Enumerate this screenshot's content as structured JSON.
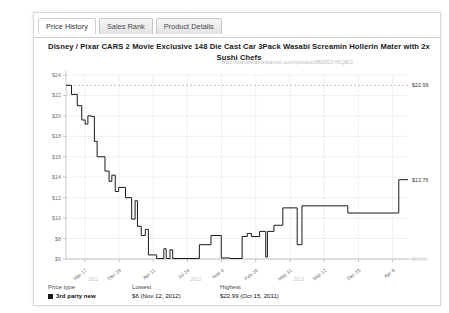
{
  "tabs": [
    {
      "label": "Price History",
      "active": true
    },
    {
      "label": "Sales Rank",
      "active": false
    },
    {
      "label": "Product Details",
      "active": false
    }
  ],
  "chart_data": {
    "type": "line",
    "title": "Disney / Pixar CARS 2 Movie Exclusive 148 Die Cast Car 3Pack Wasabi Screamin Hollerin Mater with 2x Sushi Chefs",
    "url": "http://camelcamelcamel.com/product/B0053YRQEG",
    "xlabel": "",
    "ylabel": "",
    "ylim": [
      6,
      24
    ],
    "ytick_labels": [
      "$24",
      "$22",
      "$20",
      "$18",
      "$16",
      "$14",
      "$12",
      "$10",
      "$8",
      "$6"
    ],
    "ytick_values": [
      24,
      22,
      20,
      18,
      16,
      14,
      12,
      10,
      8,
      6
    ],
    "xtick_labels": [
      "Mar 17",
      "Dec 29",
      "Apr 11",
      "Jul 24",
      "Nov 4",
      "Feb 16",
      "May 31",
      "Sep 12",
      "Dec 25",
      "Apr 8"
    ],
    "year_markers": [
      "2011",
      "2012",
      "2013"
    ],
    "grid": true,
    "legend_position": "below",
    "annotations": [
      {
        "label": "$22.99",
        "value": 22.99,
        "position": "right-top",
        "type": "highest"
      },
      {
        "label": "$13.76",
        "value": 13.76,
        "position": "right-current",
        "type": "current"
      },
      {
        "label": "$6.00",
        "value": 6.0,
        "position": "right-bottom",
        "type": "lowest"
      }
    ],
    "series": [
      {
        "name": "3rd party new",
        "color": "#1a1a1a",
        "step": true,
        "points": [
          [
            0.0,
            22.99
          ],
          [
            1.6,
            22.99
          ],
          [
            1.6,
            22.1
          ],
          [
            3.3,
            22.1
          ],
          [
            3.3,
            21.0
          ],
          [
            4.6,
            21.0
          ],
          [
            4.6,
            19.6
          ],
          [
            5.6,
            19.6
          ],
          [
            5.6,
            19.2
          ],
          [
            6.4,
            19.2
          ],
          [
            6.4,
            20.0
          ],
          [
            7.4,
            20.0
          ],
          [
            7.4,
            19.95
          ],
          [
            8.3,
            19.95
          ],
          [
            8.3,
            17.5
          ],
          [
            9.1,
            17.5
          ],
          [
            9.1,
            16.0
          ],
          [
            11.4,
            16.0
          ],
          [
            11.4,
            14.6
          ],
          [
            12.6,
            14.6
          ],
          [
            12.6,
            13.6
          ],
          [
            13.4,
            13.6
          ],
          [
            13.4,
            14.2
          ],
          [
            14.4,
            14.2
          ],
          [
            14.4,
            12.6
          ],
          [
            15.4,
            12.6
          ],
          [
            15.4,
            13.0
          ],
          [
            17.4,
            13.0
          ],
          [
            17.4,
            12.0
          ],
          [
            19.2,
            12.0
          ],
          [
            19.2,
            9.9
          ],
          [
            20.2,
            9.9
          ],
          [
            20.2,
            11.7
          ],
          [
            20.9,
            11.7
          ],
          [
            20.9,
            9.2
          ],
          [
            22.0,
            9.2
          ],
          [
            22.0,
            8.3
          ],
          [
            23.2,
            8.3
          ],
          [
            23.2,
            8.9
          ],
          [
            24.1,
            8.9
          ],
          [
            24.1,
            6.4
          ],
          [
            26.5,
            6.4
          ],
          [
            26.5,
            6.05
          ],
          [
            28.6,
            6.05
          ],
          [
            28.6,
            7.0
          ],
          [
            29.3,
            7.0
          ],
          [
            29.3,
            6.05
          ],
          [
            30.4,
            6.05
          ],
          [
            30.4,
            6.9
          ],
          [
            31.2,
            6.9
          ],
          [
            31.2,
            6.05
          ],
          [
            39.0,
            6.05
          ],
          [
            39.0,
            7.4
          ],
          [
            42.4,
            7.4
          ],
          [
            42.4,
            8.3
          ],
          [
            45.4,
            8.3
          ],
          [
            45.4,
            6.1
          ],
          [
            48.0,
            6.1
          ],
          [
            48.0,
            6.05
          ],
          [
            51.5,
            6.05
          ],
          [
            51.5,
            8.2
          ],
          [
            53.0,
            8.2
          ],
          [
            53.0,
            8.5
          ],
          [
            54.2,
            8.5
          ],
          [
            54.2,
            8.2
          ],
          [
            56.6,
            8.2
          ],
          [
            56.6,
            8.7
          ],
          [
            58.4,
            8.7
          ],
          [
            58.4,
            6.2
          ],
          [
            58.9,
            6.2
          ],
          [
            58.9,
            8.7
          ],
          [
            60.8,
            8.7
          ],
          [
            60.8,
            9.3
          ],
          [
            63.4,
            9.3
          ],
          [
            63.4,
            11.0
          ],
          [
            67.6,
            11.0
          ],
          [
            67.6,
            7.4
          ],
          [
            69.0,
            7.4
          ],
          [
            69.0,
            11.2
          ],
          [
            82.4,
            11.2
          ],
          [
            82.4,
            10.5
          ],
          [
            97.3,
            10.5
          ],
          [
            97.3,
            13.76
          ],
          [
            100.0,
            13.76
          ]
        ]
      }
    ]
  },
  "legend": {
    "headers": [
      "Price type",
      "Lowest",
      "Highest"
    ],
    "rows": [
      {
        "price_type": "3rd party new",
        "lowest": "$6 (Nov 12, 2012)",
        "highest": "$22.99 (Oct 15, 2011)"
      }
    ]
  }
}
